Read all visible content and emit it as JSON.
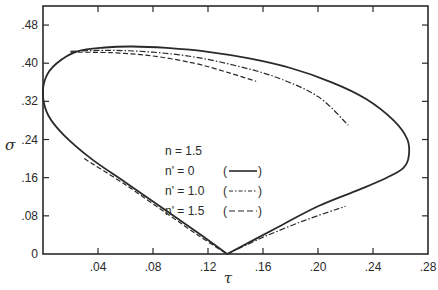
{
  "chart_data": {
    "type": "line",
    "title": "",
    "xlabel": "τ",
    "ylabel": "σ",
    "xlim": [
      0,
      0.28
    ],
    "ylim": [
      0,
      0.52
    ],
    "x_ticks": [
      0.04,
      0.08,
      0.12,
      0.16,
      0.2,
      0.24,
      0.28
    ],
    "x_tick_labels": [
      ".04",
      ".08",
      ".12",
      ".16",
      ".20",
      ".24",
      ".28"
    ],
    "y_ticks": [
      0,
      0.08,
      0.16,
      0.24,
      0.32,
      0.4,
      0.48
    ],
    "y_tick_labels": [
      "0",
      ".08",
      ".16",
      ".24",
      ".32",
      ".40",
      ".48"
    ],
    "grid": false,
    "legend_position": "center",
    "legend": {
      "header": "n = 1.5",
      "entries": [
        {
          "label": "n' = 0",
          "style_label": "(——)",
          "linestyle": "solid"
        },
        {
          "label": "n' = 1.0",
          "style_label": "(-·-·-)",
          "linestyle": "dashdot"
        },
        {
          "label": "n' = 1.5",
          "style_label": "(---)",
          "linestyle": "dashed"
        }
      ]
    },
    "series": [
      {
        "name": "n' = 0",
        "linestyle": "solid",
        "points": [
          [
            0.134,
            0.0
          ],
          [
            0.115,
            0.04
          ],
          [
            0.09,
            0.09
          ],
          [
            0.06,
            0.15
          ],
          [
            0.035,
            0.2
          ],
          [
            0.015,
            0.25
          ],
          [
            0.004,
            0.29
          ],
          [
            0.0,
            0.33
          ],
          [
            0.002,
            0.37
          ],
          [
            0.01,
            0.4
          ],
          [
            0.025,
            0.425
          ],
          [
            0.045,
            0.433
          ],
          [
            0.065,
            0.435
          ],
          [
            0.09,
            0.432
          ],
          [
            0.12,
            0.424
          ],
          [
            0.15,
            0.41
          ],
          [
            0.18,
            0.39
          ],
          [
            0.21,
            0.36
          ],
          [
            0.235,
            0.325
          ],
          [
            0.255,
            0.28
          ],
          [
            0.265,
            0.24
          ],
          [
            0.266,
            0.204
          ],
          [
            0.262,
            0.18
          ],
          [
            0.25,
            0.16
          ],
          [
            0.23,
            0.135
          ],
          [
            0.2,
            0.1
          ],
          [
            0.17,
            0.055
          ],
          [
            0.134,
            0.0
          ]
        ]
      },
      {
        "name": "n' = 1.0",
        "linestyle": "dashdot",
        "points": [
          [
            0.02,
            0.425
          ],
          [
            0.05,
            0.427
          ],
          [
            0.08,
            0.423
          ],
          [
            0.11,
            0.413
          ],
          [
            0.14,
            0.395
          ],
          [
            0.17,
            0.37
          ],
          [
            0.2,
            0.33
          ],
          [
            0.222,
            0.27
          ]
        ],
        "lower_points": [
          [
            0.134,
            0.0
          ],
          [
            0.16,
            0.035
          ],
          [
            0.19,
            0.07
          ],
          [
            0.22,
            0.1
          ]
        ]
      },
      {
        "name": "n' = 1.5",
        "linestyle": "dashed",
        "points": [
          [
            0.02,
            0.423
          ],
          [
            0.05,
            0.422
          ],
          [
            0.08,
            0.415
          ],
          [
            0.11,
            0.4
          ],
          [
            0.135,
            0.38
          ],
          [
            0.155,
            0.362
          ]
        ],
        "lower_points": [
          [
            0.03,
            0.2
          ],
          [
            0.06,
            0.145
          ],
          [
            0.09,
            0.085
          ],
          [
            0.115,
            0.035
          ],
          [
            0.134,
            0.0
          ]
        ]
      }
    ]
  }
}
